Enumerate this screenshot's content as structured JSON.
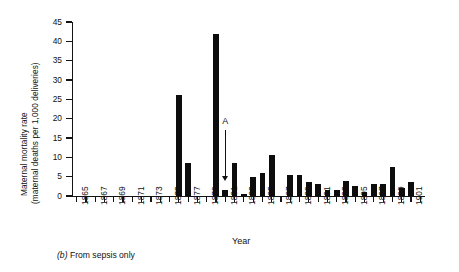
{
  "chart_data": {
    "type": "bar",
    "title": "",
    "xlabel": "Year",
    "ylabel": "Maternal mortality rate (maternal deaths per 1,000 deliveries)",
    "ylabel_line1": "Maternal mortality rate",
    "ylabel_line2": "(maternal deaths per 1,000 deliveries)",
    "ylim": [
      0,
      45
    ],
    "ytick_values": [
      0,
      5,
      10,
      15,
      20,
      25,
      30,
      35,
      40,
      45
    ],
    "xlim": [
      1864.5,
      1902.5
    ],
    "xtick_labels": [
      "1865",
      "1867",
      "1869",
      "1871",
      "1873",
      "1875",
      "1877",
      "1879",
      "1881",
      "1883",
      "1885",
      "1887",
      "1889",
      "1891",
      "1893",
      "1895",
      "1897",
      "1899",
      "1901"
    ],
    "grid": false,
    "legend": false,
    "bar_color": "#0d0d0d",
    "categories": [
      1865,
      1866,
      1867,
      1868,
      1869,
      1870,
      1871,
      1872,
      1873,
      1874,
      1875,
      1876,
      1877,
      1878,
      1879,
      1880,
      1881,
      1882,
      1883,
      1884,
      1885,
      1886,
      1887,
      1888,
      1889,
      1890,
      1891,
      1892,
      1893,
      1894,
      1895,
      1896,
      1897,
      1898,
      1899,
      1900,
      1901,
      1902
    ],
    "values": [
      0,
      0,
      0,
      0,
      0,
      0,
      0,
      0,
      0,
      0,
      0,
      26,
      8.5,
      0,
      0,
      42,
      1.5,
      8.5,
      0.4,
      5,
      6,
      10.5,
      0,
      5.5,
      5.5,
      3.5,
      3,
      1.5,
      1.5,
      4,
      2.5,
      1,
      3,
      3,
      7.5,
      2,
      3.5,
      0
    ],
    "annotations": [
      {
        "label": "A",
        "points_to_year": 1881,
        "arrow": "down"
      }
    ],
    "caption_prefix": "(b)",
    "caption_text": "From sepsis only"
  }
}
